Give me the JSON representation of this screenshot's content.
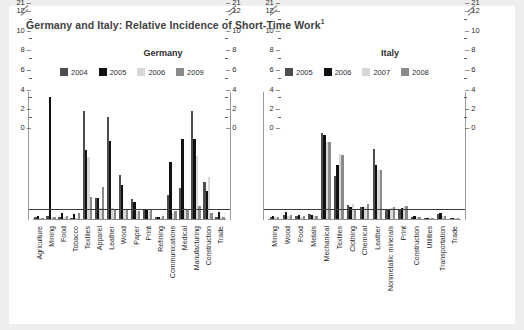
{
  "title": "Germany and Italy: Relative Incidence of Short-Time Work",
  "title_superscript": "1",
  "colors": {
    "series_a": "#4d4d4d",
    "series_b": "#111111",
    "series_c": "#d8d8d8",
    "series_d": "#8a8a8a",
    "axis": "#8d8d8d",
    "reference_line": "#3a3a3a",
    "background": "#ffffff",
    "page_background": "#efeeec"
  },
  "axis": {
    "tick_labels": [
      "0",
      "2",
      "4",
      "6",
      "8",
      "10",
      "12",
      "21"
    ],
    "tick_values": [
      0,
      2,
      4,
      6,
      8,
      10,
      12,
      21
    ],
    "break_note": "axis break between 12 and 21",
    "reference_line_value": 1
  },
  "chart_data": [
    {
      "type": "bar",
      "title": "Germany",
      "xlabel": "",
      "ylabel": "",
      "ylim": [
        0,
        13
      ],
      "grid": false,
      "legend_position": "top",
      "reference_line": 1,
      "axis_break": {
        "from": 12,
        "to": 21
      },
      "categories": [
        "Agriculture",
        "Mining",
        "Food",
        "Tobacco",
        "Textiles",
        "Apparel",
        "Leather",
        "Wood",
        "Paper",
        "Print",
        "Refining",
        "Communications",
        "Medical",
        "Manufacturing",
        "Construction",
        "Trade"
      ],
      "series": [
        {
          "name": "2004",
          "color": "#4d4d4d",
          "values": [
            0.2,
            0.3,
            0.2,
            0.1,
            11.0,
            2.1,
            10.4,
            4.5,
            2.0,
            1.0,
            0.2,
            2.4,
            3.1,
            11.0,
            3.8,
            0.2
          ]
        },
        {
          "name": "2005",
          "color": "#111111",
          "values": [
            0.3,
            12.2,
            0.6,
            0.5,
            7.0,
            2.1,
            7.9,
            3.5,
            1.7,
            1.0,
            0.2,
            5.8,
            8.1,
            8.1,
            2.8,
            0.7
          ]
        },
        {
          "name": "2006",
          "color": "#d8d8d8",
          "values": [
            0.1,
            0.2,
            0.2,
            0.1,
            6.3,
            1.1,
            1.1,
            1.0,
            0.8,
            0.8,
            0.1,
            0.6,
            1.1,
            6.4,
            4.3,
            0.2
          ]
        },
        {
          "name": "2009",
          "color": "#8a8a8a",
          "values": [
            0.1,
            0.2,
            0.3,
            0.6,
            2.2,
            3.3,
            1.0,
            1.0,
            0.8,
            1.0,
            0.3,
            0.8,
            0.9,
            1.3,
            0.6,
            0.2
          ]
        }
      ]
    },
    {
      "type": "bar",
      "title": "Italy",
      "xlabel": "",
      "ylabel": "",
      "ylim": [
        0,
        13
      ],
      "grid": false,
      "legend_position": "top",
      "reference_line": 1,
      "axis_break": {
        "from": 12,
        "to": 21
      },
      "categories": [
        "Mining",
        "Wood",
        "Food",
        "Metals",
        "Mechanical",
        "Textiles",
        "Clothing",
        "Chemical",
        "Leather",
        "Nonmetallic minerals",
        "Print",
        "Construction",
        "Utilities",
        "Transportation",
        "Trade"
      ],
      "series": [
        {
          "name": "2005",
          "color": "#4d4d4d",
          "values": [
            0.2,
            0.4,
            0.3,
            0.5,
            8.7,
            4.4,
            1.4,
            1.2,
            7.1,
            0.9,
            1.0,
            0.2,
            0.1,
            0.5,
            0.1
          ]
        },
        {
          "name": "2006",
          "color": "#111111",
          "values": [
            0.3,
            0.7,
            0.4,
            0.4,
            8.5,
            5.5,
            1.2,
            1.2,
            5.5,
            1.0,
            1.1,
            0.3,
            0.1,
            0.6,
            0.1
          ]
        },
        {
          "name": "2007",
          "color": "#d8d8d8",
          "values": [
            0.2,
            0.3,
            0.2,
            0.3,
            7.8,
            6.6,
            1.5,
            1.2,
            5.0,
            1.1,
            1.2,
            0.2,
            0.1,
            0.3,
            0.1
          ]
        },
        {
          "name": "2008",
          "color": "#8a8a8a",
          "values": [
            0.2,
            0.4,
            0.3,
            0.3,
            7.8,
            6.5,
            1.0,
            1.5,
            5.0,
            1.2,
            1.3,
            0.2,
            0.1,
            0.3,
            0.1
          ]
        }
      ]
    }
  ]
}
